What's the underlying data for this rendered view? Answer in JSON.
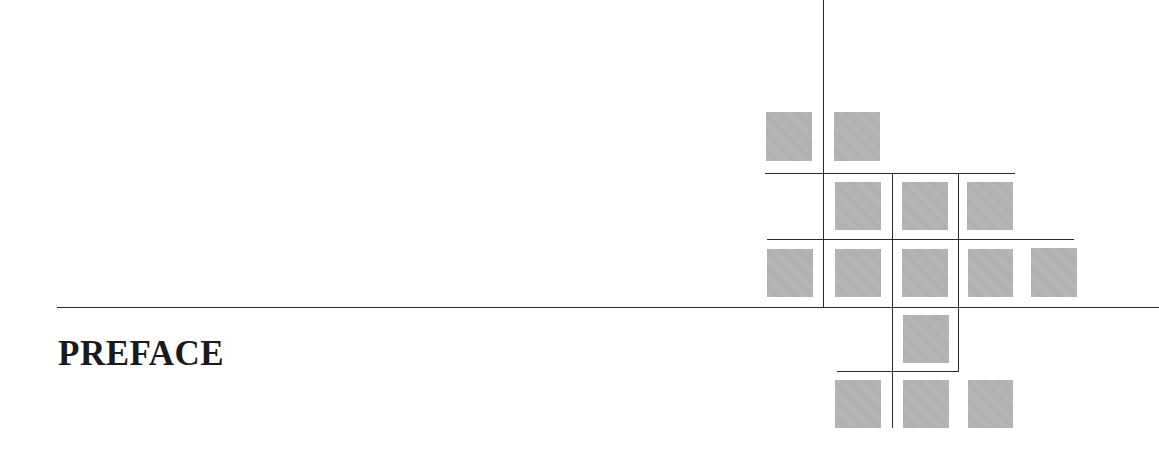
{
  "heading": {
    "text": "PREFACE"
  },
  "colors": {
    "square": "#b4b4b4",
    "rule": "#2a2a2a",
    "text": "#1a1a1a",
    "background": "#ffffff"
  },
  "decoration": {
    "squares": [
      {
        "x": 766,
        "y": 112,
        "w": 46,
        "h": 49
      },
      {
        "x": 834,
        "y": 112,
        "w": 46,
        "h": 49
      },
      {
        "x": 835,
        "y": 182,
        "w": 46,
        "h": 48
      },
      {
        "x": 902,
        "y": 182,
        "w": 46,
        "h": 48
      },
      {
        "x": 967,
        "y": 182,
        "w": 46,
        "h": 48
      },
      {
        "x": 767,
        "y": 249,
        "w": 46,
        "h": 48
      },
      {
        "x": 835,
        "y": 249,
        "w": 46,
        "h": 48
      },
      {
        "x": 902,
        "y": 249,
        "w": 46,
        "h": 48
      },
      {
        "x": 968,
        "y": 249,
        "w": 45,
        "h": 48
      },
      {
        "x": 1031,
        "y": 248,
        "w": 46,
        "h": 49
      },
      {
        "x": 903,
        "y": 315,
        "w": 46,
        "h": 48
      },
      {
        "x": 835,
        "y": 380,
        "w": 46,
        "h": 48
      },
      {
        "x": 903,
        "y": 380,
        "w": 46,
        "h": 48
      },
      {
        "x": 968,
        "y": 380,
        "w": 45,
        "h": 48
      }
    ],
    "lines": [
      {
        "x": 823,
        "y": 0,
        "w": 1,
        "h": 307
      },
      {
        "x": 765,
        "y": 173,
        "w": 250,
        "h": 1
      },
      {
        "x": 892,
        "y": 173,
        "w": 1,
        "h": 255
      },
      {
        "x": 958,
        "y": 173,
        "w": 1,
        "h": 198
      },
      {
        "x": 767,
        "y": 239,
        "w": 307,
        "h": 1
      },
      {
        "x": 57,
        "y": 307,
        "w": 1102,
        "h": 1
      },
      {
        "x": 837,
        "y": 371,
        "w": 122,
        "h": 1
      }
    ]
  }
}
